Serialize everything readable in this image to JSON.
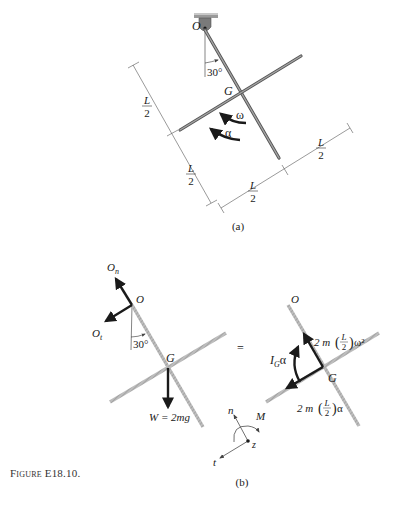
{
  "figure": {
    "caption": "Figure E18.10.",
    "panel_a": {
      "label": "(a)",
      "pivot_label": "O",
      "center_label": "G",
      "angle_label": "30°",
      "omega_label": "ω",
      "alpha_label": "α",
      "dimensions": [
        {
          "num": "L",
          "den": "2",
          "position": "left-upper"
        },
        {
          "num": "L",
          "den": "2",
          "position": "left-lower"
        },
        {
          "num": "L",
          "den": "2",
          "position": "bottom-left"
        },
        {
          "num": "L",
          "den": "2",
          "position": "bottom-right"
        }
      ]
    },
    "panel_b": {
      "label": "(b)",
      "equals": "=",
      "fbd": {
        "pivot_label": "O",
        "center_label": "G",
        "angle_label": "30°",
        "normal_reaction": "O",
        "normal_reaction_sub": "n",
        "tangential_reaction": "O",
        "tangential_reaction_sub": "t",
        "weight_label": "W = 2mg"
      },
      "kd": {
        "pivot_label": "O",
        "center_label": "G",
        "moment_label": "I",
        "moment_sub": "G",
        "moment_suffix": "α",
        "normal_force_prefix": "2 m",
        "normal_force_frac_num": "L",
        "normal_force_frac_den": "2",
        "normal_force_suffix": "ω²",
        "tangential_force_prefix": "2 m",
        "tangential_force_frac_num": "L",
        "tangential_force_frac_den": "2",
        "tangential_force_suffix": "α"
      },
      "axes": {
        "n": "n",
        "t": "t",
        "z": "z",
        "M": "M"
      }
    }
  }
}
